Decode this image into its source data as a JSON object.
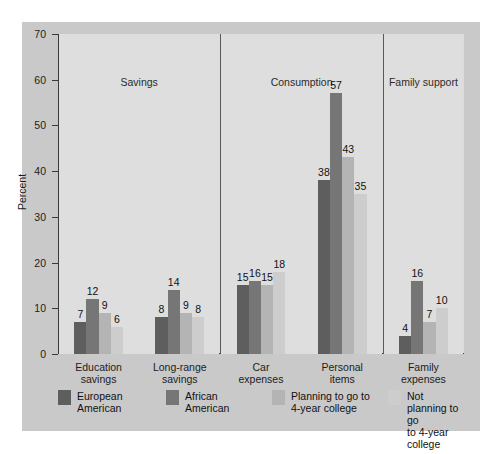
{
  "chart_data": {
    "type": "bar",
    "title": "",
    "xlabel": "",
    "ylabel": "Percent",
    "ylim": [
      0,
      70
    ],
    "yticks": [
      0,
      10,
      20,
      30,
      40,
      50,
      60,
      70
    ],
    "grid": false,
    "legend_position": "bottom",
    "panels": [
      {
        "name": "Savings",
        "categories": [
          "Education savings",
          "Long-range savings"
        ]
      },
      {
        "name": "Consumption",
        "categories": [
          "Car expenses",
          "Personal items"
        ]
      },
      {
        "name": "Family support",
        "categories": [
          "Family expenses"
        ]
      }
    ],
    "categories": [
      "Education\nsavings",
      "Long-range\nsavings",
      "Car\nexpenses",
      "Personal\nitems",
      "Family\nexpenses"
    ],
    "series": [
      {
        "name": "European\nAmerican",
        "color": "#5e5e5e",
        "values": [
          7,
          8,
          15,
          38,
          4
        ]
      },
      {
        "name": "African\nAmerican",
        "color": "#767676",
        "values": [
          12,
          14,
          16,
          57,
          16
        ]
      },
      {
        "name": "Planning to go to\n4-year college",
        "color": "#b4b4b4",
        "values": [
          9,
          9,
          15,
          43,
          7
        ]
      },
      {
        "name": "Not planning to go\nto 4-year college",
        "color": "#cdcdcd",
        "values": [
          6,
          8,
          18,
          35,
          10
        ]
      }
    ]
  },
  "colors": {
    "figure_background": "#c9c9c9",
    "plot_background": "#dcdcdc",
    "panel_band": "#dedede",
    "axis": "#3a3a3a",
    "text": "#1c1c1c"
  }
}
